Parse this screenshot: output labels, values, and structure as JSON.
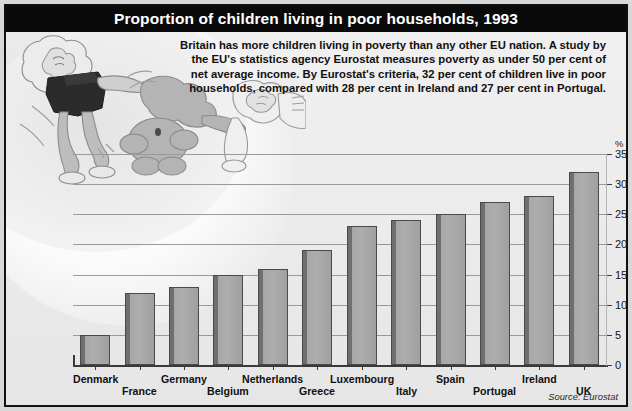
{
  "title": "Proportion of children living in poor households, 1993",
  "blurb": "Britain has more children living in poverty than any other EU nation. A study by the EU's statistics agency Eurostat measures poverty as under 50 per cent of net average income. By Eurostat's criteria, 32 per cent of children live in poor households, compared with 28 per cent in Ireland and 27 per cent in Portugal.",
  "source": "Source: Eurostat",
  "unit_label": "%",
  "colors": {
    "title_bar": "#0a0a0a",
    "title_text": "#ffffff",
    "panel_bg": "#ededed",
    "bar_face": "#adadad",
    "bar_shadow": "#6f6f6f",
    "bar_outline": "#4a4a4a",
    "gridline": "#9a9a9a",
    "axis": "#3a3a3a"
  },
  "chart_data": {
    "type": "bar",
    "title": "Proportion of children living in poor households, 1993",
    "xlabel": "",
    "ylabel": "%",
    "ylim": [
      0,
      35
    ],
    "yticks": [
      0,
      5,
      10,
      15,
      20,
      25,
      30,
      35
    ],
    "grid": true,
    "legend": null,
    "categories": [
      "Denmark",
      "France",
      "Germany",
      "Belgium",
      "Netherlands",
      "Greece",
      "Luxembourg",
      "Italy",
      "Spain",
      "Portugal",
      "Ireland",
      "UK"
    ],
    "values": [
      5,
      12,
      13,
      15,
      16,
      19,
      23,
      24,
      25,
      27,
      28,
      32
    ]
  }
}
